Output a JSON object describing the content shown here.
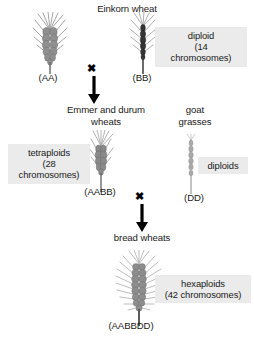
{
  "diagram": {
    "title_einkorn": "Einkorn wheat",
    "title_emmer": "Emmer and durum\nwheats",
    "title_goat": "goat\ngrasses",
    "title_bread": "bread wheats",
    "genomes": {
      "aa": "(AA)",
      "bb": "(BB)",
      "aabb": "(AABB)",
      "dd": "(DD)",
      "aabbdd": "(AABBDD)"
    },
    "boxes": {
      "diploid_14": "diploid\n(14\nchromosomes)",
      "tetraploids_28": "tetraploids\n(28\nchromosomes)",
      "diploids": "diploids",
      "hexaploids_42": "hexaploids\n(42 chromosomes)"
    },
    "cross_symbol": "✖",
    "colors": {
      "box_background": "#ebebeb",
      "text": "#1a1a1a",
      "arrow": "#000000",
      "spike_light": "#b4b4b4",
      "spike_mid": "#8c8c8c",
      "spike_dark": "#4a4a4a",
      "page_background": "#ffffff"
    },
    "plants": {
      "aa": "einkorn-wheat-spike",
      "bb": "wild-emmer-wheat-spike",
      "aabb": "emmer-durum-wheat-spike",
      "dd": "goat-grass-spike",
      "aabbdd": "bread-wheat-spike"
    }
  }
}
